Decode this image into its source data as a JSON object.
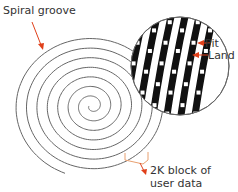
{
  "labels": {
    "spiral_groove": "Spiral groove",
    "pit": "Pit",
    "land": "Land",
    "block_line1": "2K block of",
    "block_line2": "user data"
  },
  "colors": {
    "spiral": "#555555",
    "arrow": "#e0401a",
    "bracket": "#e8a070",
    "track": "#111111",
    "text": "#333333"
  }
}
